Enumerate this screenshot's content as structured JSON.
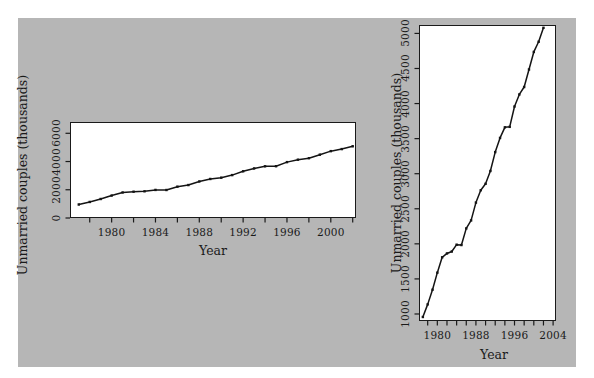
{
  "figure": {
    "background_color": "#ffffff",
    "panel_color": "#b6b6b6",
    "plot_background": "#ffffff",
    "ink_color": "#1a1a1a"
  },
  "chart_data": [
    {
      "id": "left-panel",
      "type": "line",
      "title": "",
      "xlabel": "Year",
      "ylabel": "Unmarried couples (thousands)",
      "xlim": [
        1976.2,
        2002.3
      ],
      "ylim": [
        0,
        6800
      ],
      "grid": false,
      "legend": "none",
      "y_ticks": [
        0,
        2000,
        4000,
        6000
      ],
      "y_tick_labels": [
        "0",
        "2000",
        "4000",
        "6000"
      ],
      "x_ticks": [
        1978,
        1980,
        1982,
        1984,
        1986,
        1988,
        1990,
        1992,
        1994,
        1996,
        1998,
        2000,
        2002
      ],
      "x_tick_labels": [
        "",
        "1980",
        "",
        "1984",
        "",
        "1988",
        "",
        "1992",
        "",
        "1996",
        "",
        "2000",
        ""
      ],
      "x": [
        1977,
        1978,
        1979,
        1980,
        1981,
        1982,
        1983,
        1984,
        1985,
        1986,
        1987,
        1988,
        1989,
        1990,
        1991,
        1992,
        1993,
        1994,
        1995,
        1996,
        1997,
        1998,
        1999,
        2000,
        2001,
        2002
      ],
      "values": [
        957,
        1137,
        1346,
        1589,
        1808,
        1863,
        1891,
        1988,
        1983,
        2220,
        2334,
        2588,
        2764,
        2856,
        3039,
        3308,
        3510,
        3661,
        3668,
        3958,
        4130,
        4236,
        4486,
        4736,
        4881,
        5080
      ]
    },
    {
      "id": "right-panel",
      "type": "line",
      "title": "",
      "xlabel": "Year",
      "ylabel": "Unmarried couples (thousands)",
      "xlim": [
        1976.2,
        2004.6
      ],
      "ylim": [
        900,
        5120
      ],
      "grid": false,
      "legend": "none",
      "y_ticks": [
        1000,
        1500,
        2000,
        2500,
        3000,
        3500,
        4000,
        4500,
        5000
      ],
      "y_tick_labels": [
        "1000",
        "1500",
        "2000",
        "2500",
        "3000",
        "3500",
        "4000",
        "4500",
        "5000"
      ],
      "x_ticks": [
        1978,
        1980,
        1982,
        1984,
        1986,
        1988,
        1990,
        1992,
        1994,
        1996,
        1998,
        2000,
        2002,
        2004
      ],
      "x_tick_labels": [
        "",
        "1980",
        "",
        "",
        "",
        "1988",
        "",
        "",
        "",
        "1996",
        "",
        "",
        "",
        "2004"
      ],
      "x": [
        1977,
        1978,
        1979,
        1980,
        1981,
        1982,
        1983,
        1984,
        1985,
        1986,
        1987,
        1988,
        1989,
        1990,
        1991,
        1992,
        1993,
        1994,
        1995,
        1996,
        1997,
        1998,
        1999,
        2000,
        2001,
        2002
      ],
      "values": [
        957,
        1137,
        1346,
        1589,
        1808,
        1863,
        1891,
        1988,
        1983,
        2220,
        2334,
        2588,
        2764,
        2856,
        3039,
        3308,
        3510,
        3661,
        3668,
        3958,
        4130,
        4236,
        4486,
        4736,
        4881,
        5080
      ]
    }
  ]
}
